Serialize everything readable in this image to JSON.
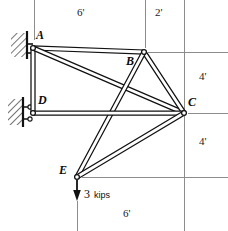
{
  "figure": {
    "width": 228,
    "height": 231,
    "background": "#ffffff",
    "member_fill": "#ffffff",
    "member_stroke": "#111111",
    "guide_color": "#8c8c8c",
    "hatch_color": "#2b2b2b"
  },
  "joints": [
    {
      "id": "A",
      "label": "A",
      "x": 33,
      "y": 48,
      "label_x": 36,
      "label_y": 30,
      "support": "fixed-wall"
    },
    {
      "id": "B",
      "label": "B",
      "x": 144,
      "y": 52,
      "label_x": 127,
      "label_y": 56,
      "support": "none"
    },
    {
      "id": "C",
      "label": "C",
      "x": 184,
      "y": 113,
      "label_x": 188,
      "label_y": 97,
      "support": "none"
    },
    {
      "id": "D",
      "label": "D",
      "x": 33,
      "y": 113,
      "label_x": 38,
      "label_y": 95,
      "support": "roller-wall"
    },
    {
      "id": "E",
      "label": "E",
      "x": 77,
      "y": 177,
      "label_x": 60,
      "label_y": 165,
      "support": "none"
    }
  ],
  "members": [
    {
      "id": "AB",
      "from": "A",
      "to": "B",
      "width": 4.0
    },
    {
      "id": "AD",
      "from": "A",
      "to": "D",
      "width": 4.0
    },
    {
      "id": "AC",
      "from": "A",
      "to": "C",
      "width": 4.0
    },
    {
      "id": "BC",
      "from": "B",
      "to": "C",
      "width": 4.0
    },
    {
      "id": "BE",
      "from": "B",
      "to": "E",
      "width": 4.0
    },
    {
      "id": "DC",
      "from": "D",
      "to": "C",
      "width": 4.0
    },
    {
      "id": "CE",
      "from": "C",
      "to": "E",
      "width": 4.0
    }
  ],
  "load": {
    "at_joint": "E",
    "magnitude": "3",
    "unit": "kips",
    "direction": "down",
    "arrow_x": 77,
    "arrow_from_y": 180,
    "arrow_to_y": 199,
    "label_x": 86,
    "label_y": 190
  },
  "dimensions": [
    {
      "id": "top-left",
      "label": "6'",
      "x": 83,
      "y": 12
    },
    {
      "id": "top-right",
      "label": "2'",
      "x": 160,
      "y": 12
    },
    {
      "id": "right-upper",
      "label": "4'",
      "x": 203,
      "y": 75
    },
    {
      "id": "right-lower",
      "label": "4'",
      "x": 203,
      "y": 140
    },
    {
      "id": "bottom",
      "label": "6'",
      "x": 128,
      "y": 213
    }
  ],
  "guide_lines": {
    "vertical": [
      {
        "id": "v-at-A",
        "x": 34,
        "y1": 0,
        "y2": 40
      },
      {
        "id": "v-at-B",
        "x": 145,
        "y1": 0,
        "y2": 48
      },
      {
        "id": "v-at-C",
        "x": 184,
        "y1": 0,
        "y2": 231
      },
      {
        "id": "v-at-E",
        "x": 77,
        "y1": 201,
        "y2": 231
      }
    ],
    "horizontal": [
      {
        "id": "h-at-B",
        "x1": 148,
        "x2": 228,
        "y": 52
      },
      {
        "id": "h-at-C",
        "x1": 188,
        "x2": 228,
        "y": 113
      },
      {
        "id": "h-at-E",
        "x1": 82,
        "x2": 228,
        "y": 177
      }
    ]
  }
}
